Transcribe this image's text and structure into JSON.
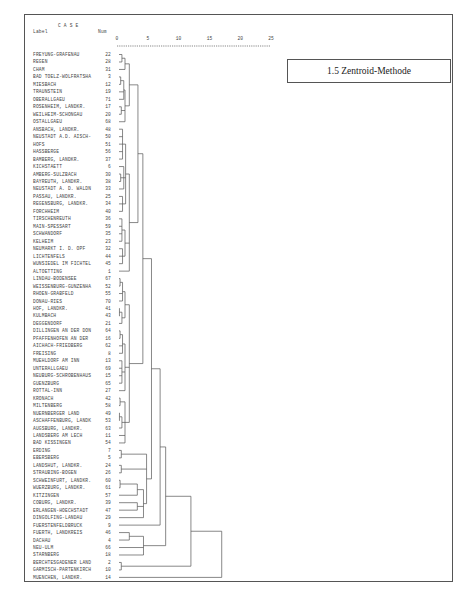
{
  "title_box": "1.5 Zentroid-Methode",
  "header": {
    "case": "C A S E",
    "label": "Label",
    "num": "Num",
    "scale_ticks": [
      "0",
      "5",
      "10",
      "15",
      "20",
      "25"
    ]
  },
  "chart_data": {
    "type": "dendrogram",
    "title": "1.5 Zentroid-Methode",
    "method": "Zentroid-Methode",
    "xlabel": "Rescaled Distance Cluster Combine",
    "axis_ticks": [
      0,
      5,
      10,
      15,
      20,
      25
    ],
    "axis_range": [
      0,
      25
    ],
    "cases": [
      {
        "label": "FREYUNG-GRAFENAU",
        "num": "22"
      },
      {
        "label": "REGEN",
        "num": "28"
      },
      {
        "label": "CHAM",
        "num": "31"
      },
      {
        "label": "BAD TOELZ-WOLFRATSHA",
        "num": "3"
      },
      {
        "label": "MIESBACH",
        "num": "12"
      },
      {
        "label": "TRAUNSTEIN",
        "num": "19"
      },
      {
        "label": "OBERALLGAEU",
        "num": "71"
      },
      {
        "label": "ROSENHEIM, LANDKR.",
        "num": "17"
      },
      {
        "label": "WEILHEIM-SCHONGAU",
        "num": "20"
      },
      {
        "label": "OSTALLGAEU",
        "num": "68"
      },
      {
        "label": "ANSBACH, LANDKR.",
        "num": "48"
      },
      {
        "label": "NEUSTADT A.D. AISCH-",
        "num": "50"
      },
      {
        "label": "HOFS",
        "num": "51"
      },
      {
        "label": "HASSBERGE",
        "num": "56"
      },
      {
        "label": "BAMBERG, LANDKR.",
        "num": "37"
      },
      {
        "label": "KICHSTAETT",
        "num": "6"
      },
      {
        "label": "AMBERG-SULZBACH",
        "num": "30"
      },
      {
        "label": "BAYREUTH, LANDKR.",
        "num": "38"
      },
      {
        "label": "NEUSTADT A. D. WALDN",
        "num": "33"
      },
      {
        "label": "PASSAU, LANDKR.",
        "num": "25"
      },
      {
        "label": "REGENSBURG, LANDKR.",
        "num": "34"
      },
      {
        "label": "FORCHHEIM",
        "num": "40"
      },
      {
        "label": "TIRSCHENREUTH",
        "num": "36"
      },
      {
        "label": "MAIN-SPESSART",
        "num": "59"
      },
      {
        "label": "SCHWANDORF",
        "num": "35"
      },
      {
        "label": "KELHEIM",
        "num": "23"
      },
      {
        "label": "NEUMARKT I. D. OPF",
        "num": "32"
      },
      {
        "label": "LICHTENFELS",
        "num": "44"
      },
      {
        "label": "WUNSIEDEL IM FICHTEL",
        "num": "45"
      },
      {
        "label": "ALTOETTING",
        "num": "1"
      },
      {
        "label": "LINDAU-BODENSEE",
        "num": "67"
      },
      {
        "label": "WEISSENBURG-GUNZENHA",
        "num": "52"
      },
      {
        "label": "RHOEN-GRABFELD",
        "num": "55"
      },
      {
        "label": "DONAU-RIES",
        "num": "70"
      },
      {
        "label": "HOF, LANDKR.",
        "num": "41"
      },
      {
        "label": "KULMBACH",
        "num": "43"
      },
      {
        "label": "DEGGENDORF",
        "num": "21"
      },
      {
        "label": "DILLINGEN AN DER DON",
        "num": "64"
      },
      {
        "label": "PFAFFENHOFEN AN DER",
        "num": "16"
      },
      {
        "label": "AICHACH-FRIEDBERG",
        "num": "62"
      },
      {
        "label": "FREISING",
        "num": "8"
      },
      {
        "label": "MUEHLDORF AM INN",
        "num": "13"
      },
      {
        "label": "UNTERALLGAEU",
        "num": "69"
      },
      {
        "label": "NEUBURG-SCHROBENHAUS",
        "num": "15"
      },
      {
        "label": "GUENZBURG",
        "num": "65"
      },
      {
        "label": "ROTTAL-INN",
        "num": "27"
      },
      {
        "label": "KRONACH",
        "num": "42"
      },
      {
        "label": "MILTENBERG",
        "num": "58"
      },
      {
        "label": "NUERNBERGER LAND",
        "num": "49"
      },
      {
        "label": "ASCHAFFENBURG, LANDK",
        "num": "53"
      },
      {
        "label": "AUGSBURG, LANDKR.",
        "num": "63"
      },
      {
        "label": "LANDSBERG AM LECH",
        "num": "11"
      },
      {
        "label": "BAD KISSINGEN",
        "num": "54"
      },
      {
        "label": "ERDING",
        "num": "7"
      },
      {
        "label": "EBERSBERG",
        "num": "5"
      },
      {
        "label": "LANDSHUT, LANDKR.",
        "num": "24"
      },
      {
        "label": "STRAUBING-BOGEN",
        "num": "26"
      },
      {
        "label": "SCHWEINFURT, LANDKR.",
        "num": "60"
      },
      {
        "label": "WUERZBURG, LANDKR.",
        "num": "61"
      },
      {
        "label": "KITZINGEN",
        "num": "57"
      },
      {
        "label": "COBURG, LANDKR.",
        "num": "39"
      },
      {
        "label": "ERLANGEN-HOECHSTADT",
        "num": "47"
      },
      {
        "label": "DINGOLFING-LANDAU",
        "num": "29"
      },
      {
        "label": "FUERSTENFELDBRUCK",
        "num": "9"
      },
      {
        "label": "FUERTH, LANDKREIS",
        "num": "46"
      },
      {
        "label": "DACHAU",
        "num": "4"
      },
      {
        "label": "NEU-ULM",
        "num": "66"
      },
      {
        "label": "STARNBERG",
        "num": "18"
      },
      {
        "label": "BERCHTESGADENER LAND",
        "num": "2"
      },
      {
        "label": "GARMISCH-PARTENKIRCH",
        "num": "10"
      },
      {
        "label": "MUENCHEN, LANDKR.",
        "num": "14"
      }
    ]
  }
}
